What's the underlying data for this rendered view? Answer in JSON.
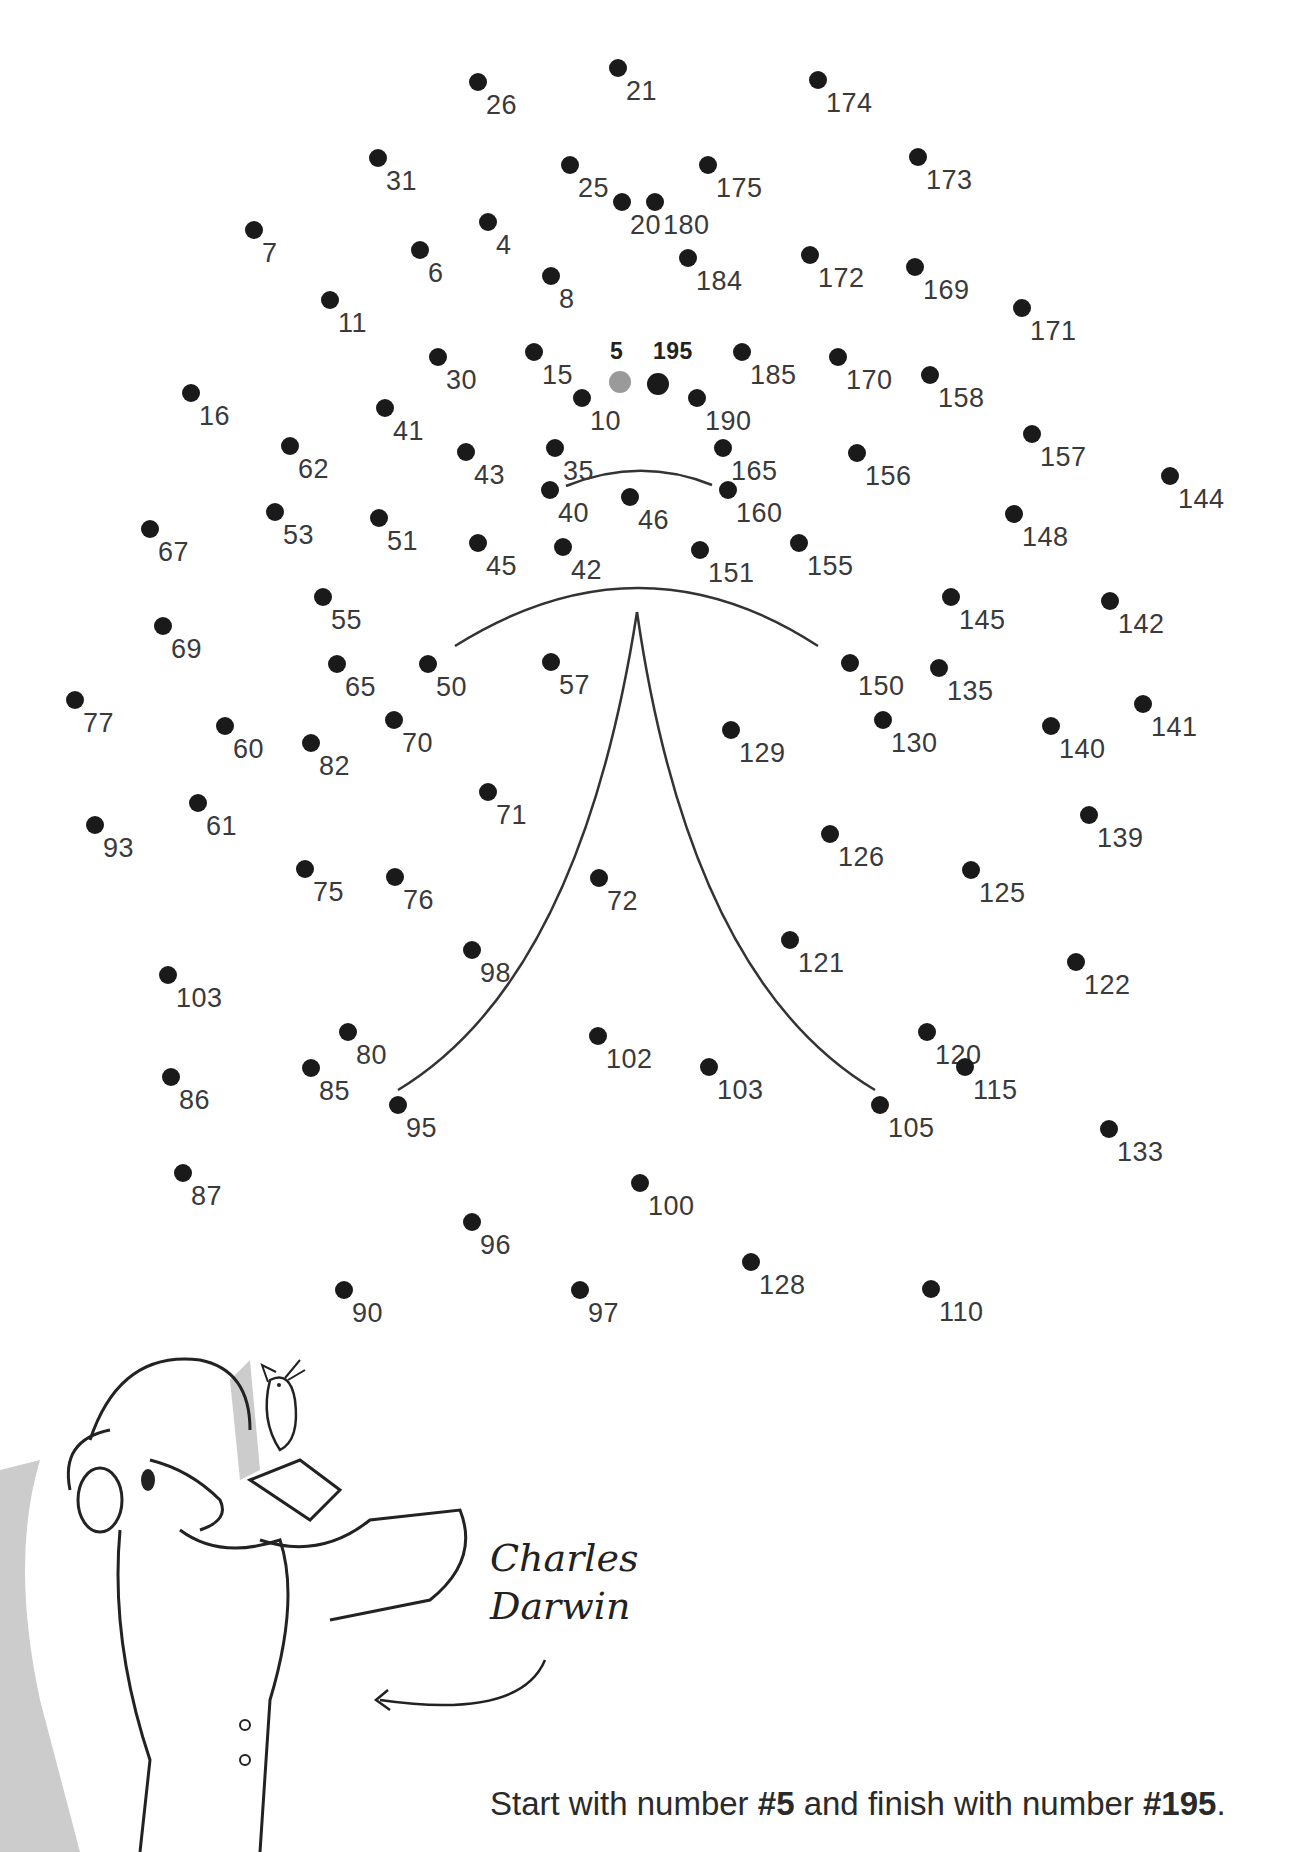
{
  "puzzle": {
    "type": "dot-to-dot",
    "start_number": "5",
    "finish_number": "195",
    "dots": [
      {
        "n": "26",
        "x": 478,
        "y": 82
      },
      {
        "n": "21",
        "x": 618,
        "y": 68
      },
      {
        "n": "174",
        "x": 818,
        "y": 80
      },
      {
        "n": "31",
        "x": 378,
        "y": 158
      },
      {
        "n": "25",
        "x": 570,
        "y": 165
      },
      {
        "n": "175",
        "x": 708,
        "y": 165
      },
      {
        "n": "173",
        "x": 918,
        "y": 157
      },
      {
        "n": "20",
        "x": 622,
        "y": 202
      },
      {
        "n": "180",
        "x": 655,
        "y": 202
      },
      {
        "n": "7",
        "x": 254,
        "y": 230
      },
      {
        "n": "4",
        "x": 488,
        "y": 222
      },
      {
        "n": "6",
        "x": 420,
        "y": 250
      },
      {
        "n": "8",
        "x": 551,
        "y": 276
      },
      {
        "n": "184",
        "x": 688,
        "y": 258
      },
      {
        "n": "172",
        "x": 810,
        "y": 255
      },
      {
        "n": "169",
        "x": 915,
        "y": 267
      },
      {
        "n": "11",
        "x": 330,
        "y": 300
      },
      {
        "n": "171",
        "x": 1022,
        "y": 308
      },
      {
        "n": "30",
        "x": 438,
        "y": 357
      },
      {
        "n": "15",
        "x": 534,
        "y": 352
      },
      {
        "n": "185",
        "x": 742,
        "y": 352
      },
      {
        "n": "170",
        "x": 838,
        "y": 357
      },
      {
        "n": "158",
        "x": 930,
        "y": 375
      },
      {
        "n": "10",
        "x": 582,
        "y": 398
      },
      {
        "n": "190",
        "x": 697,
        "y": 398
      },
      {
        "n": "16",
        "x": 191,
        "y": 393
      },
      {
        "n": "41",
        "x": 385,
        "y": 408
      },
      {
        "n": "62",
        "x": 290,
        "y": 446
      },
      {
        "n": "43",
        "x": 466,
        "y": 452
      },
      {
        "n": "35",
        "x": 555,
        "y": 448
      },
      {
        "n": "165",
        "x": 723,
        "y": 448
      },
      {
        "n": "156",
        "x": 857,
        "y": 453
      },
      {
        "n": "157",
        "x": 1032,
        "y": 434
      },
      {
        "n": "40",
        "x": 550,
        "y": 490
      },
      {
        "n": "46",
        "x": 630,
        "y": 497
      },
      {
        "n": "160",
        "x": 728,
        "y": 490
      },
      {
        "n": "144",
        "x": 1170,
        "y": 476
      },
      {
        "n": "53",
        "x": 275,
        "y": 512
      },
      {
        "n": "51",
        "x": 379,
        "y": 518
      },
      {
        "n": "67",
        "x": 150,
        "y": 529
      },
      {
        "n": "148",
        "x": 1014,
        "y": 514
      },
      {
        "n": "45",
        "x": 478,
        "y": 543
      },
      {
        "n": "42",
        "x": 563,
        "y": 547
      },
      {
        "n": "151",
        "x": 700,
        "y": 550
      },
      {
        "n": "155",
        "x": 799,
        "y": 543
      },
      {
        "n": "55",
        "x": 323,
        "y": 597
      },
      {
        "n": "145",
        "x": 951,
        "y": 597
      },
      {
        "n": "142",
        "x": 1110,
        "y": 601
      },
      {
        "n": "69",
        "x": 163,
        "y": 626
      },
      {
        "n": "50",
        "x": 428,
        "y": 664
      },
      {
        "n": "57",
        "x": 551,
        "y": 662
      },
      {
        "n": "65",
        "x": 337,
        "y": 664
      },
      {
        "n": "150",
        "x": 850,
        "y": 663
      },
      {
        "n": "135",
        "x": 939,
        "y": 668
      },
      {
        "n": "77",
        "x": 75,
        "y": 700
      },
      {
        "n": "60",
        "x": 225,
        "y": 726
      },
      {
        "n": "82",
        "x": 311,
        "y": 743
      },
      {
        "n": "70",
        "x": 394,
        "y": 720
      },
      {
        "n": "129",
        "x": 731,
        "y": 730
      },
      {
        "n": "130",
        "x": 883,
        "y": 720
      },
      {
        "n": "140",
        "x": 1051,
        "y": 726
      },
      {
        "n": "141",
        "x": 1143,
        "y": 704
      },
      {
        "n": "71",
        "x": 488,
        "y": 792
      },
      {
        "n": "61",
        "x": 198,
        "y": 803
      },
      {
        "n": "93",
        "x": 95,
        "y": 825
      },
      {
        "n": "126",
        "x": 830,
        "y": 834
      },
      {
        "n": "139",
        "x": 1089,
        "y": 815
      },
      {
        "n": "75",
        "x": 305,
        "y": 869
      },
      {
        "n": "76",
        "x": 395,
        "y": 877
      },
      {
        "n": "72",
        "x": 599,
        "y": 878
      },
      {
        "n": "125",
        "x": 971,
        "y": 870
      },
      {
        "n": "98",
        "x": 472,
        "y": 950
      },
      {
        "n": "121",
        "x": 790,
        "y": 940
      },
      {
        "n": "122",
        "x": 1076,
        "y": 962
      },
      {
        "n": "103",
        "x": 168,
        "y": 975
      },
      {
        "n": "120",
        "x": 927,
        "y": 1032
      },
      {
        "n": "80",
        "x": 348,
        "y": 1032
      },
      {
        "n": "102",
        "x": 598,
        "y": 1036
      },
      {
        "n": "103",
        "x": 709,
        "y": 1067
      },
      {
        "n": "115",
        "x": 965,
        "y": 1067
      },
      {
        "n": "86",
        "x": 171,
        "y": 1077
      },
      {
        "n": "85",
        "x": 311,
        "y": 1068
      },
      {
        "n": "95",
        "x": 398,
        "y": 1105
      },
      {
        "n": "105",
        "x": 880,
        "y": 1105
      },
      {
        "n": "133",
        "x": 1109,
        "y": 1129
      },
      {
        "n": "87",
        "x": 183,
        "y": 1173
      },
      {
        "n": "100",
        "x": 640,
        "y": 1183
      },
      {
        "n": "96",
        "x": 472,
        "y": 1222
      },
      {
        "n": "128",
        "x": 751,
        "y": 1262
      },
      {
        "n": "90",
        "x": 344,
        "y": 1290
      },
      {
        "n": "97",
        "x": 580,
        "y": 1290
      },
      {
        "n": "110",
        "x": 931,
        "y": 1289
      }
    ],
    "start_dot": {
      "n": "5",
      "x": 620,
      "y": 382
    },
    "finish_dot": {
      "n": "195",
      "x": 658,
      "y": 384
    }
  },
  "caption": {
    "name_line1": "Charles",
    "name_line2": "Darwin"
  },
  "instructions": {
    "prefix": "Start with number ",
    "start": "#5",
    "middle": " and finish with number ",
    "finish": "#195",
    "suffix": "."
  },
  "colors": {
    "dot": "#1a1a1a",
    "start_dot": "#9a9a9a",
    "text": "#3a3a3a",
    "guide_line": "#333333",
    "shading": "#cccccc"
  }
}
